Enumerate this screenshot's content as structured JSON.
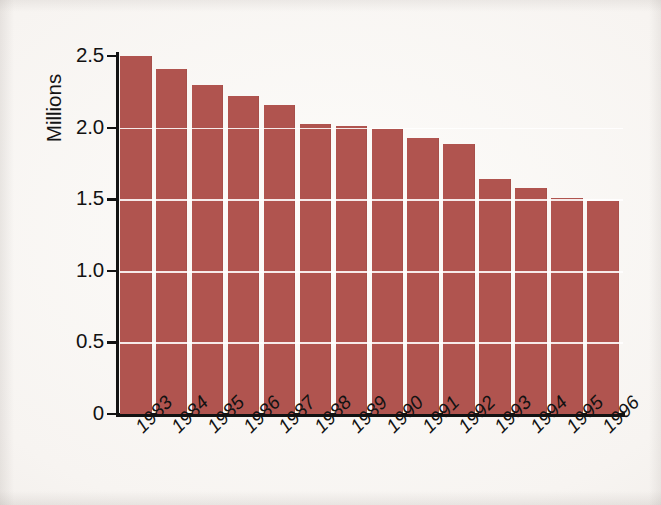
{
  "chart_data": {
    "type": "bar",
    "title": "",
    "subtitle": "",
    "xlabel": "",
    "ylabel": "Millions",
    "categories": [
      "1983",
      "1984",
      "1985",
      "1986",
      "1987",
      "1988",
      "1989",
      "1990",
      "1991",
      "1992",
      "1993",
      "1994",
      "1995",
      "1996"
    ],
    "values": [
      2.5,
      2.41,
      2.3,
      2.22,
      2.16,
      2.03,
      2.01,
      1.99,
      1.93,
      1.89,
      1.64,
      1.58,
      1.51,
      1.49
    ],
    "series": [
      {
        "name": "Millions",
        "values": [
          2.5,
          2.41,
          2.3,
          2.22,
          2.16,
          2.03,
          2.01,
          1.99,
          1.93,
          1.89,
          1.64,
          1.58,
          1.51,
          1.49
        ]
      }
    ],
    "ylim": [
      0,
      2.53
    ],
    "xlim_categories": 14,
    "ytick_labels": [
      "2.5",
      "2.0",
      "1.5",
      "1.0",
      "0.5",
      "0"
    ],
    "ytick_values": [
      2.5,
      2.0,
      1.5,
      1.0,
      0.5,
      0
    ],
    "gridlines": {
      "horizontal": true,
      "vertical": false,
      "color": "#FFFFFF",
      "at_values": [
        2.0,
        1.5,
        1.0,
        0.5
      ]
    },
    "legend": {
      "present": false,
      "position": "none",
      "entries": []
    },
    "annotations": [],
    "bar_color": "#B0544F",
    "axis_color": "#121212",
    "background_color": "#F7F4F1",
    "xtick_label_rotation_deg": -45,
    "ylabel_rotation_deg": -90
  }
}
